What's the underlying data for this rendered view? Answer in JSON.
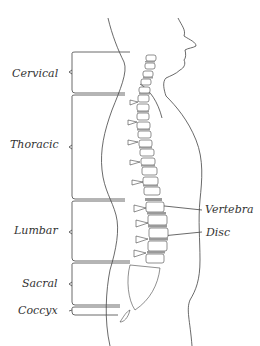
{
  "diagram": {
    "region_labels": [
      {
        "id": "cervical",
        "label": "Cervical"
      },
      {
        "id": "thoracic",
        "label": "Thoracic"
      },
      {
        "id": "lumbar",
        "label": "Lumbar"
      },
      {
        "id": "sacral",
        "label": "Sacral"
      },
      {
        "id": "coccyx",
        "label": "Coccyx"
      }
    ],
    "part_labels": [
      {
        "id": "vertebra",
        "label": "Vertebra"
      },
      {
        "id": "disc",
        "label": "Disc"
      }
    ],
    "colors": {
      "line": "#444444",
      "bone_fill": "#ffffff",
      "disc_fill": "#9a9a9a",
      "text": "#333333",
      "background": "#ffffff"
    }
  }
}
